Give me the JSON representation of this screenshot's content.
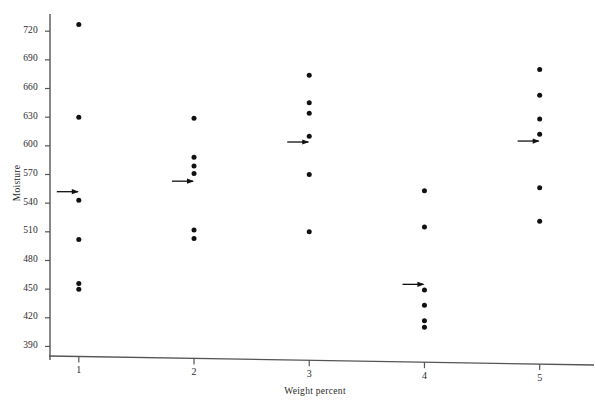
{
  "chart_data": {
    "type": "scatter",
    "title": "",
    "xlabel": "Weight percent",
    "ylabel": "Moisture",
    "x": [
      1,
      2,
      3,
      4,
      5
    ],
    "xtick_labels": [
      "1",
      "2",
      "3",
      "4",
      "5"
    ],
    "ytick_labels": [
      "390",
      "420",
      "450",
      "480",
      "510",
      "540",
      "570",
      "600",
      "630",
      "660",
      "690",
      "720"
    ],
    "ytick_values": [
      390,
      420,
      450,
      480,
      510,
      540,
      570,
      600,
      630,
      660,
      690,
      720
    ],
    "xlim": [
      0.75,
      5.35
    ],
    "ylim": [
      380,
      738
    ],
    "grid": false,
    "legend": null,
    "marker_color": "#111111",
    "axis_color": "#555555",
    "mean_marker": "left-pointing-arrow",
    "groups": [
      {
        "x": 1,
        "label": "1",
        "values": [
          727,
          630,
          543,
          502,
          456,
          450
        ],
        "mean": 552
      },
      {
        "x": 2,
        "label": "2",
        "values": [
          629,
          588,
          579,
          571,
          512,
          503
        ],
        "mean": 563
      },
      {
        "x": 3,
        "label": "3",
        "values": [
          674,
          645,
          634,
          610,
          570,
          510
        ],
        "mean": 604
      },
      {
        "x": 4,
        "label": "4",
        "values": [
          553,
          515,
          449,
          433,
          417,
          410
        ],
        "mean": 455
      },
      {
        "x": 5,
        "label": "5",
        "values": [
          680,
          653,
          628,
          612,
          556,
          521
        ],
        "mean": 605
      }
    ]
  },
  "axes": {
    "plot_left_px": 50,
    "plot_right_px": 580,
    "plot_top_px": 14,
    "plot_bottom_px": 356,
    "y_top_value": 738,
    "y_bottom_value": 380
  }
}
